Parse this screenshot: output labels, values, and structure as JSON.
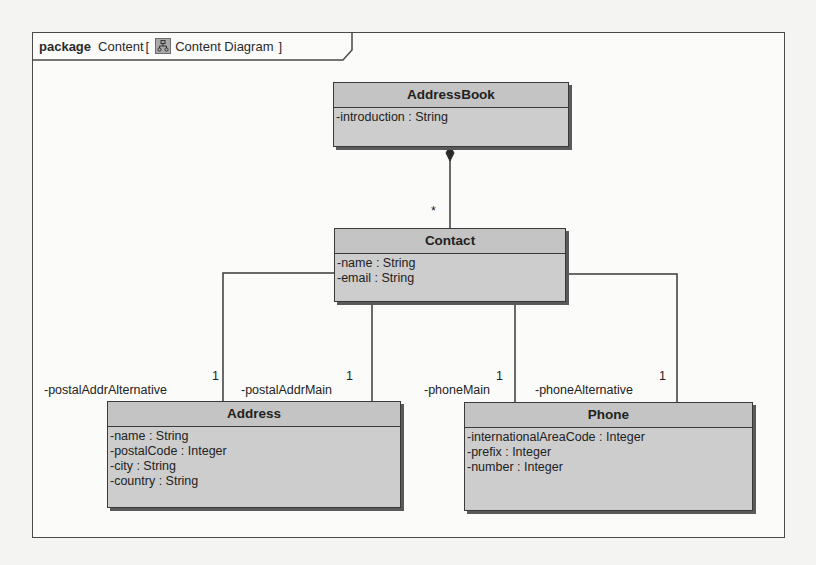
{
  "frame": {
    "keyword": "package",
    "name": "Content",
    "open_bracket": "[",
    "diagram_icon": "class-diagram-icon",
    "diagram_name": "Content Diagram",
    "close_bracket": "]"
  },
  "classes": [
    {
      "id": "AddressBook",
      "name": "AddressBook",
      "attributes": [
        "-introduction : String"
      ]
    },
    {
      "id": "Contact",
      "name": "Contact",
      "attributes": [
        "-name : String",
        "-email : String"
      ]
    },
    {
      "id": "Address",
      "name": "Address",
      "attributes": [
        "-name : String",
        "-postalCode : Integer",
        "-city : String",
        "-country : String"
      ]
    },
    {
      "id": "Phone",
      "name": "Phone",
      "attributes": [
        "-internationalAreaCode : Integer",
        "-prefix : Integer",
        "-number : Integer"
      ]
    }
  ],
  "associations": [
    {
      "from": "AddressBook",
      "to": "Contact",
      "kind": "composition",
      "target_multiplicity": "*"
    },
    {
      "from": "Contact",
      "to": "Address",
      "role": "-postalAddrAlternative",
      "multiplicity": "1"
    },
    {
      "from": "Contact",
      "to": "Address",
      "role": "-postalAddrMain",
      "multiplicity": "1"
    },
    {
      "from": "Contact",
      "to": "Phone",
      "role": "-phoneMain",
      "multiplicity": "1"
    },
    {
      "from": "Contact",
      "to": "Phone",
      "role": "-phoneAlternative",
      "multiplicity": "1"
    }
  ],
  "colors": {
    "class_fill": "#c9c9c9",
    "border": "#3a3a3a",
    "shadow": "#5a5a5a",
    "frame_bg": "#fbfbfa"
  }
}
